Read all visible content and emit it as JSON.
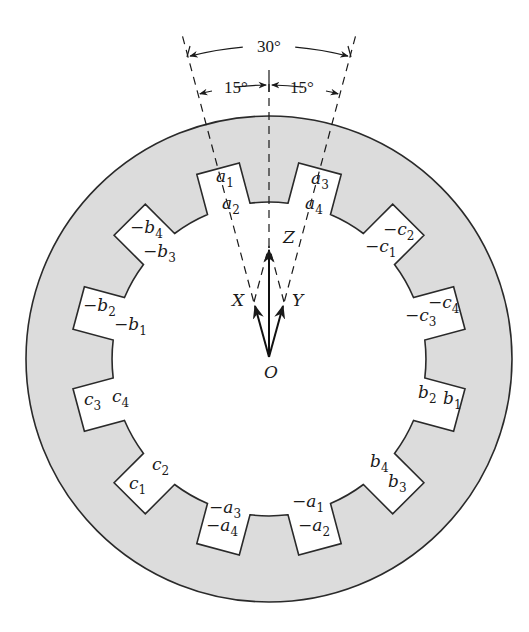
{
  "diagram": {
    "type": "stator-slot-winding",
    "center": {
      "x": 269,
      "y": 359
    },
    "outer_radius": 243,
    "bore_radius": 157,
    "slot_outer_radius": 197,
    "slot_count": 12,
    "slot_pitch_deg": 30,
    "colors": {
      "iron": "#dcdcdc",
      "stroke": "#2a2a2a",
      "background": "#ffffff"
    }
  },
  "dimensions": {
    "total_angle": "30°",
    "left_half_angle": "15°",
    "right_half_angle": "15°"
  },
  "vectors": {
    "origin_label": "O",
    "x_label": "X",
    "y_label": "Y",
    "z_label": "Z"
  },
  "slots": [
    {
      "angle": 345,
      "labels": [
        {
          "sign": "",
          "base": "a",
          "sub": "1",
          "x": 216,
          "y": 182
        },
        {
          "sign": "",
          "base": "a",
          "sub": "2",
          "x": 222,
          "y": 209
        }
      ]
    },
    {
      "angle": 15,
      "labels": [
        {
          "sign": "",
          "base": "a",
          "sub": "3",
          "x": 311,
          "y": 184
        },
        {
          "sign": "",
          "base": "a",
          "sub": "4",
          "x": 305,
          "y": 209
        }
      ]
    },
    {
      "angle": 45,
      "labels": [
        {
          "sign": "−",
          "base": "c",
          "sub": "2",
          "x": 383,
          "y": 235
        },
        {
          "sign": "−",
          "base": "c",
          "sub": "1",
          "x": 365,
          "y": 252
        }
      ]
    },
    {
      "angle": 75,
      "labels": [
        {
          "sign": "−",
          "base": "c",
          "sub": "4",
          "x": 428,
          "y": 308
        },
        {
          "sign": "−",
          "base": "c",
          "sub": "3",
          "x": 405,
          "y": 321
        }
      ]
    },
    {
      "angle": 105,
      "labels": [
        {
          "sign": "",
          "base": "b",
          "sub": "2",
          "x": 418,
          "y": 398
        },
        {
          "sign": "",
          "base": "b",
          "sub": "1",
          "x": 443,
          "y": 404
        }
      ]
    },
    {
      "angle": 135,
      "labels": [
        {
          "sign": "",
          "base": "b",
          "sub": "4",
          "x": 370,
          "y": 467
        },
        {
          "sign": "",
          "base": "b",
          "sub": "3",
          "x": 388,
          "y": 487
        }
      ]
    },
    {
      "angle": 165,
      "labels": [
        {
          "sign": "−",
          "base": "a",
          "sub": "1",
          "x": 292,
          "y": 507
        },
        {
          "sign": "−",
          "base": "a",
          "sub": "2",
          "x": 298,
          "y": 531
        }
      ]
    },
    {
      "angle": 195,
      "labels": [
        {
          "sign": "−",
          "base": "a",
          "sub": "3",
          "x": 209,
          "y": 513
        },
        {
          "sign": "−",
          "base": "a",
          "sub": "4",
          "x": 206,
          "y": 531
        }
      ]
    },
    {
      "angle": 225,
      "labels": [
        {
          "sign": "",
          "base": "c",
          "sub": "2",
          "x": 152,
          "y": 470
        },
        {
          "sign": "",
          "base": "c",
          "sub": "1",
          "x": 129,
          "y": 489
        }
      ]
    },
    {
      "angle": 255,
      "labels": [
        {
          "sign": "",
          "base": "c",
          "sub": "3",
          "x": 84,
          "y": 405
        },
        {
          "sign": "",
          "base": "c",
          "sub": "4",
          "x": 112,
          "y": 402
        }
      ]
    },
    {
      "angle": 285,
      "labels": [
        {
          "sign": "−",
          "base": "b",
          "sub": "2",
          "x": 83,
          "y": 311
        },
        {
          "sign": "−",
          "base": "b",
          "sub": "1",
          "x": 114,
          "y": 330
        }
      ]
    },
    {
      "angle": 315,
      "labels": [
        {
          "sign": "−",
          "base": "b",
          "sub": "4",
          "x": 130,
          "y": 233
        },
        {
          "sign": "−",
          "base": "b",
          "sub": "3",
          "x": 143,
          "y": 257
        }
      ]
    }
  ]
}
